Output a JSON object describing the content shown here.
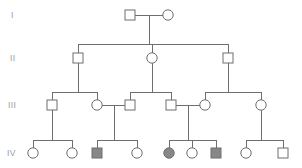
{
  "figure": {
    "kind": "pedigree-chart",
    "width": 302,
    "height": 168,
    "background_color": "#ffffff",
    "line_color": "#6e6e6e",
    "symbol_stroke_color": "#6e6e6e",
    "unaffected_fill": "#ffffff",
    "affected_fill": "#878787",
    "label_color": "#9a9a9a"
  },
  "generation_labels": [
    {
      "id": "gen-label-1",
      "text": "I",
      "x": 11,
      "y": 18
    },
    {
      "id": "gen-label-2",
      "text": "II",
      "x": 10,
      "y": 61
    },
    {
      "id": "gen-label-3",
      "text": "III",
      "x": 8,
      "y": 108
    },
    {
      "id": "gen-label-4",
      "text": "IV",
      "x": 7,
      "y": 156
    }
  ],
  "generations": [
    {
      "id": "generation-I",
      "label": "I",
      "row_y": 15,
      "individuals": [
        {
          "id": "I-1",
          "sex": "male",
          "shape": "square",
          "affected": false,
          "cx": 130,
          "cy": 15
        },
        {
          "id": "I-2",
          "sex": "female",
          "shape": "circle",
          "affected": false,
          "cx": 168,
          "cy": 15
        }
      ]
    },
    {
      "id": "generation-II",
      "label": "II",
      "row_y": 58,
      "individuals": [
        {
          "id": "II-1",
          "sex": "male",
          "shape": "square",
          "affected": false,
          "cx": 78,
          "cy": 58
        },
        {
          "id": "II-2",
          "sex": "female",
          "shape": "circle",
          "affected": false,
          "cx": 152,
          "cy": 58
        },
        {
          "id": "II-3",
          "sex": "male",
          "shape": "square",
          "affected": false,
          "cx": 228,
          "cy": 58
        }
      ]
    },
    {
      "id": "generation-III",
      "label": "III",
      "row_y": 105,
      "individuals": [
        {
          "id": "III-1",
          "sex": "male",
          "shape": "square",
          "affected": false,
          "cx": 52,
          "cy": 105
        },
        {
          "id": "III-2",
          "sex": "female",
          "shape": "circle",
          "affected": false,
          "cx": 97,
          "cy": 105
        },
        {
          "id": "III-3",
          "sex": "male",
          "shape": "square",
          "affected": false,
          "cx": 130,
          "cy": 105
        },
        {
          "id": "III-4",
          "sex": "male",
          "shape": "square",
          "affected": false,
          "cx": 171,
          "cy": 105
        },
        {
          "id": "III-5",
          "sex": "female",
          "shape": "circle",
          "affected": false,
          "cx": 205,
          "cy": 105
        },
        {
          "id": "III-6",
          "sex": "female",
          "shape": "circle",
          "affected": false,
          "cx": 261,
          "cy": 105
        }
      ]
    },
    {
      "id": "generation-IV",
      "label": "IV",
      "row_y": 153,
      "individuals": [
        {
          "id": "IV-1",
          "sex": "female",
          "shape": "circle",
          "affected": false,
          "cx": 33,
          "cy": 153
        },
        {
          "id": "IV-2",
          "sex": "female",
          "shape": "circle",
          "affected": false,
          "cx": 72,
          "cy": 153
        },
        {
          "id": "IV-3",
          "sex": "male",
          "shape": "square",
          "affected": true,
          "cx": 97,
          "cy": 153
        },
        {
          "id": "IV-4",
          "sex": "female",
          "shape": "circle",
          "affected": false,
          "cx": 137,
          "cy": 153
        },
        {
          "id": "IV-5",
          "sex": "female",
          "shape": "circle",
          "affected": true,
          "cx": 169,
          "cy": 153
        },
        {
          "id": "IV-6",
          "sex": "female",
          "shape": "circle",
          "affected": false,
          "cx": 192,
          "cy": 153
        },
        {
          "id": "IV-7",
          "sex": "male",
          "shape": "square",
          "affected": true,
          "cx": 216,
          "cy": 153
        },
        {
          "id": "IV-8",
          "sex": "female",
          "shape": "circle",
          "affected": false,
          "cx": 246,
          "cy": 153
        },
        {
          "id": "IV-9",
          "sex": "male",
          "shape": "square",
          "affected": false,
          "cx": 283,
          "cy": 153
        }
      ]
    }
  ],
  "matings": [
    {
      "id": "mating-I",
      "partners": [
        "I-1",
        "I-2"
      ],
      "x1": 135,
      "x2": 163,
      "y": 15
    },
    {
      "id": "mating-III-2-3",
      "partners": [
        "III-2",
        "III-3"
      ],
      "x1": 102,
      "x2": 125,
      "y": 105
    },
    {
      "id": "mating-III-4-5",
      "partners": [
        "III-4",
        "III-5"
      ],
      "x1": 176,
      "x2": 200,
      "y": 105
    }
  ],
  "sibships": [
    {
      "id": "sibship-II",
      "parent_x": 149,
      "bar_y": 44,
      "child_xs": [
        78,
        152,
        228
      ]
    },
    {
      "id": "sibship-III-left",
      "parent_x": 78,
      "bar_y": 92,
      "child_xs": [
        52,
        97
      ]
    },
    {
      "id": "sibship-III-mid",
      "parent_x": 152,
      "bar_y": 92,
      "child_xs": [
        130,
        171
      ]
    },
    {
      "id": "sibship-III-right",
      "parent_x": 228,
      "bar_y": 92,
      "child_xs": [
        205,
        261
      ]
    },
    {
      "id": "sibship-IV-a",
      "parent_x": 52,
      "bar_y": 140,
      "child_xs": [
        33,
        72
      ]
    },
    {
      "id": "sibship-IV-b",
      "parent_x": 114,
      "bar_y": 140,
      "child_xs": [
        97,
        137
      ]
    },
    {
      "id": "sibship-IV-c",
      "parent_x": 188,
      "bar_y": 140,
      "child_xs": [
        169,
        192,
        216
      ]
    },
    {
      "id": "sibship-IV-d",
      "parent_x": 261,
      "bar_y": 140,
      "child_xs": [
        246,
        283
      ]
    }
  ],
  "geometry": {
    "square_size": 10,
    "circle_radius": 5.2,
    "stroke_width": 1
  }
}
